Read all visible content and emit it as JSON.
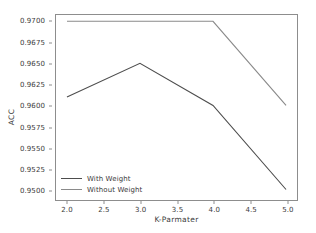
{
  "chart_data": {
    "type": "line",
    "title": "",
    "xlabel": "K-Parmater",
    "ylabel": "ACC",
    "xlim": [
      1.85,
      5.15
    ],
    "ylim": [
      0.94875,
      0.97075
    ],
    "grid": false,
    "legend_position": "lower left",
    "x": [
      2.0,
      3.0,
      4.0,
      5.0
    ],
    "xticks": [
      "2.0",
      "2.5",
      "3.0",
      "3.5",
      "4.0",
      "4.5",
      "5.0"
    ],
    "xtick_values": [
      2.0,
      2.5,
      3.0,
      3.5,
      4.0,
      4.5,
      5.0
    ],
    "yticks": [
      "0.9500",
      "0.9525",
      "0.9550",
      "0.9575",
      "0.9600",
      "0.9625",
      "0.9650",
      "0.9675",
      "0.9700"
    ],
    "ytick_values": [
      0.95,
      0.9525,
      0.955,
      0.9575,
      0.96,
      0.9625,
      0.965,
      0.9675,
      0.97
    ],
    "series": [
      {
        "name": "With Weight",
        "color": "#4d4d4d",
        "values": [
          0.961,
          0.965,
          0.96,
          0.95
        ]
      },
      {
        "name": "Without Weight",
        "color": "#8a8a8a",
        "values": [
          0.97,
          0.97,
          0.97,
          0.96
        ]
      }
    ]
  },
  "axes": {
    "frame_color": "#8d8d8d"
  }
}
